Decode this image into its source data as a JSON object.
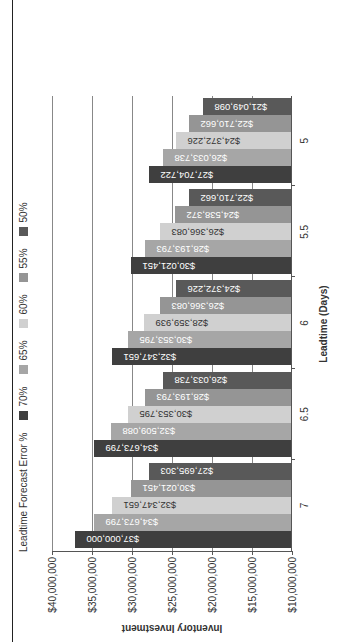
{
  "chart_data": {
    "type": "bar",
    "orientation_note": "rendered rotated 90deg counter-clockwise",
    "title": "",
    "legend_title": "Leadtime Forecast Error %",
    "xlabel": "Leadtime (Days)",
    "ylabel": "Inventory Investment",
    "ylim": [
      10000000,
      40000000
    ],
    "yticks": [
      "$10,000,000",
      "$15,000,000",
      "$20,000,000",
      "$25,000,000",
      "$30,000,000",
      "$35,000,000",
      "$40,000,000"
    ],
    "ytick_values": [
      10000000,
      15000000,
      20000000,
      25000000,
      30000000,
      35000000,
      40000000
    ],
    "grid": true,
    "legend_position": "top",
    "categories": [
      "7",
      "6.5",
      "6",
      "5.5",
      "5"
    ],
    "series": [
      {
        "name": "70%",
        "color": "#3f3f3f",
        "values": [
          37000000,
          34673799,
          32347651,
          30021451,
          27704722
        ],
        "labels": [
          "$37,000,000",
          "$34,673,799",
          "$32,347,651",
          "$30,021,451",
          "$27,704,722"
        ]
      },
      {
        "name": "65%",
        "color": "#a6a6a6",
        "values": [
          34673799,
          32509088,
          30353795,
          28193793,
          26033738
        ],
        "labels": [
          "$34,673,799",
          "$32,509,088",
          "$30,353,795",
          "$28,193,793",
          "$26,033,738"
        ]
      },
      {
        "name": "60%",
        "color": "#d0d0d0",
        "values": [
          32347651,
          30353795,
          28359939,
          26366083,
          24372226
        ],
        "labels": [
          "$32,347,651",
          "$30,353,795",
          "$28,359,939",
          "$26,366,083",
          "$24,372,226"
        ]
      },
      {
        "name": "55%",
        "color": "#959595",
        "values": [
          30021451,
          28193793,
          26366083,
          24538372,
          22710662
        ],
        "labels": [
          "$30,021,451",
          "$28,193,793",
          "$26,366,083",
          "$24,538,372",
          "$22,710,662"
        ]
      },
      {
        "name": "50%",
        "color": "#595959",
        "values": [
          27695303,
          26033738,
          24372226,
          22710662,
          21049098
        ],
        "labels": [
          "$27,695,303",
          "$26,033,738",
          "$24,372,226",
          "$22,710,662",
          "$21,049,098"
        ]
      }
    ]
  }
}
